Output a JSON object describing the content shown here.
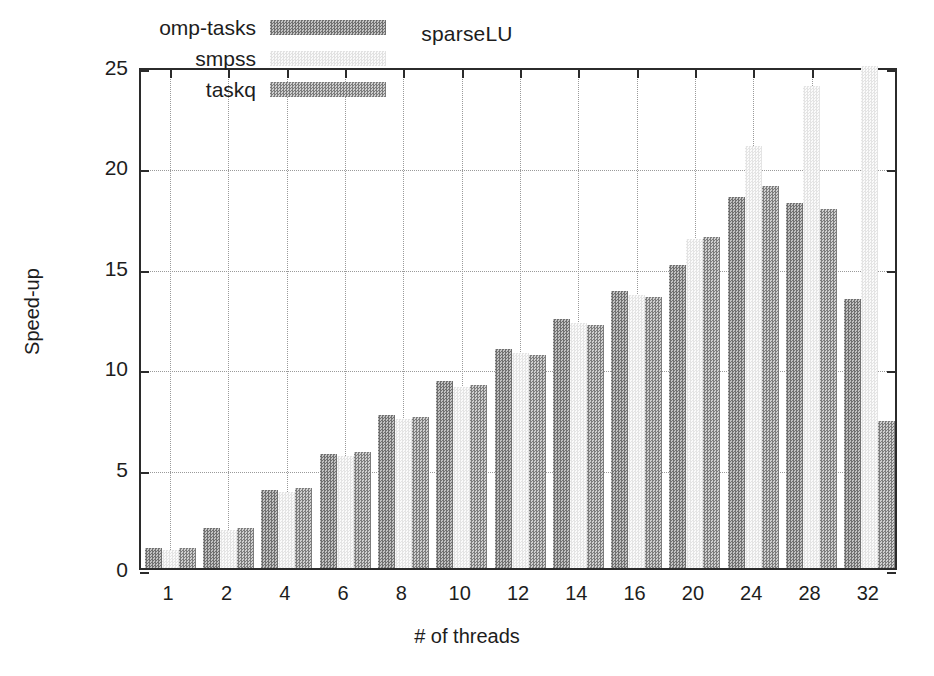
{
  "chart_data": {
    "type": "bar",
    "title": "sparseLU",
    "xlabel": "# of threads",
    "ylabel": "Speed-up",
    "categories": [
      "1",
      "2",
      "4",
      "6",
      "8",
      "10",
      "12",
      "14",
      "16",
      "20",
      "24",
      "28",
      "32"
    ],
    "ylim": [
      0,
      25
    ],
    "yticks": [
      0,
      5,
      10,
      15,
      20,
      25
    ],
    "ytick_labels": [
      "0",
      "5",
      "10",
      "15",
      "20",
      "25"
    ],
    "grid": true,
    "legend_position": "top-left inside",
    "series": [
      {
        "name": "omp-tasks",
        "color": "#8f8f8f",
        "values": [
          1.0,
          2.0,
          3.9,
          5.7,
          7.6,
          9.3,
          10.9,
          12.4,
          13.8,
          15.1,
          18.5,
          18.2,
          13.4
        ]
      },
      {
        "name": "smpss",
        "color": "#f0f0f0",
        "values": [
          0.9,
          1.9,
          3.8,
          5.6,
          7.4,
          9.0,
          10.7,
          12.2,
          13.6,
          16.4,
          21.0,
          24.0,
          26.5
        ]
      },
      {
        "name": "taskq",
        "color": "#9b9b9b",
        "values": [
          1.0,
          2.0,
          4.0,
          5.8,
          7.5,
          9.1,
          10.6,
          12.1,
          13.5,
          16.5,
          19.0,
          17.9,
          7.3
        ]
      }
    ]
  }
}
